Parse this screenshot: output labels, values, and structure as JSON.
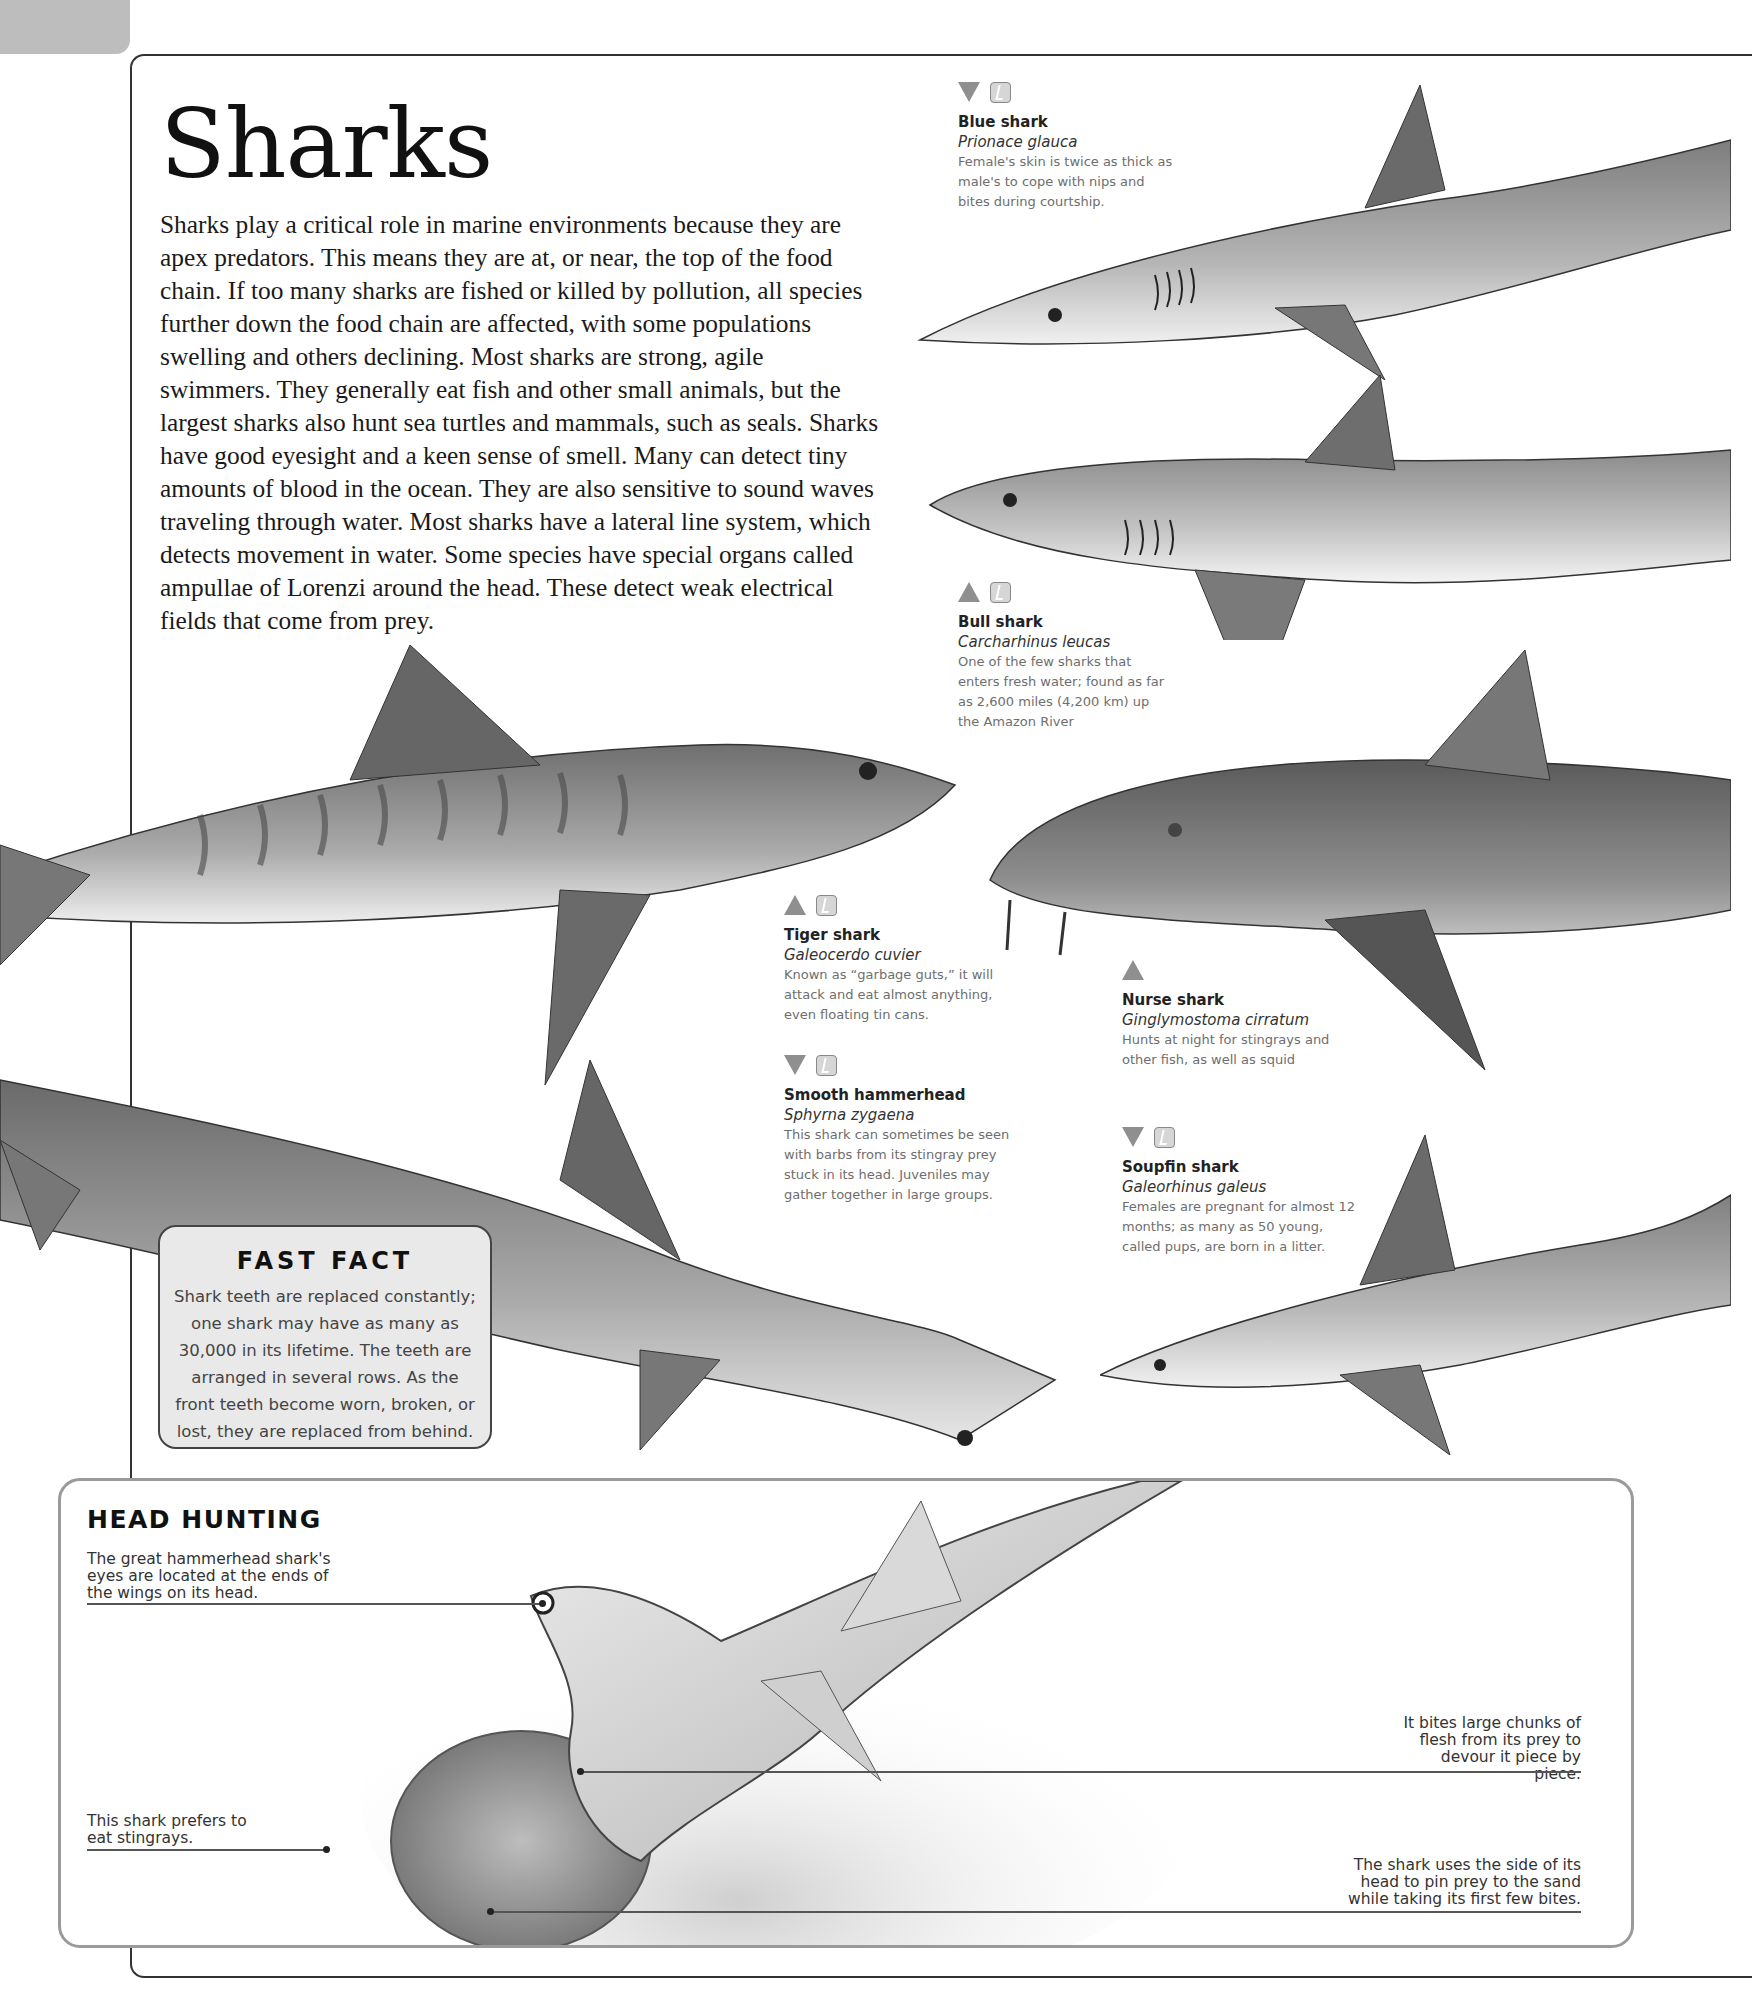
{
  "page": {
    "title": "Sharks",
    "intro": "Sharks play a critical role in marine environments because they are apex predators. This means they are at, or near, the top of the food chain. If too many sharks are fished or killed by pollution, all species further down the food chain are affected, with some populations swelling and others declining. Most sharks are strong, agile swimmers. They generally eat fish and other small animals, but the largest sharks also hunt sea turtles and mammals, such as seals. Sharks have good eyesight and a keen sense of smell. Many can detect tiny amounts of blood in the ocean. They are also sensitive to sound waves traveling through water. Most sharks have a lateral line system, which detects movement in water. Some species have special organs called ampullae of Lorenzi around the head. These detect weak electrical fields that come from prey."
  },
  "colors": {
    "icon_gray": "#8f8f8f",
    "fast_fact_bg": "#e9e9e9",
    "box_border": "#9a9a9a",
    "text": "#1a1a1a",
    "caption_text": "#6e6e6e"
  },
  "species": [
    {
      "name": "Blue shark",
      "latin": "Prionace glauca",
      "description": "Female's skin is twice as thick as male's to cope with nips and bites during courtship.",
      "trend_icon": "triangle-down",
      "status_icon": "status-box-icon"
    },
    {
      "name": "Bull shark",
      "latin": "Carcharhinus leucas",
      "description": "One of the few sharks that enters fresh water; found as far as 2,600 miles (4,200 km) up the Amazon River",
      "trend_icon": "triangle-up",
      "status_icon": "status-box-icon"
    },
    {
      "name": "Tiger shark",
      "latin": "Galeocerdo cuvier",
      "description": "Known as “garbage guts,” it will attack and eat almost anything, even floating tin cans.",
      "trend_icon": "triangle-up",
      "status_icon": "status-box-icon"
    },
    {
      "name": "Nurse shark",
      "latin": "Ginglymostoma cirratum",
      "description": "Hunts at night for stingrays and other fish, as well as squid",
      "trend_icon": "triangle-up",
      "status_icon": null
    },
    {
      "name": "Smooth hammerhead",
      "latin": "Sphyrna zygaena",
      "description": "This shark can sometimes be seen with barbs from its stingray prey stuck in its head. Juveniles may gather together in large groups.",
      "trend_icon": "triangle-down",
      "status_icon": "status-box-icon"
    },
    {
      "name": "Soupfin shark",
      "latin": "Galeorhinus galeus",
      "description": "Females are pregnant for almost 12 months; as many as 50 young, called pups, are born in a litter.",
      "trend_icon": "triangle-down",
      "status_icon": "status-box-icon"
    }
  ],
  "fast_fact": {
    "heading": "FAST FACT",
    "text": "Shark teeth are replaced constantly; one shark may have as many as 30,000 in its lifetime. The teeth are arranged in several rows. As the front teeth become worn, broken, or lost, they are replaced from behind."
  },
  "head_hunting": {
    "heading": "HEAD HUNTING",
    "notes": [
      "The great hammerhead shark's eyes are located at the ends of the wings on its head.",
      "This shark prefers to eat stingrays.",
      "It bites large chunks of flesh from its prey to devour it piece by piece.",
      "The shark uses the side of its head to pin prey to the sand while taking its first few bites."
    ]
  }
}
